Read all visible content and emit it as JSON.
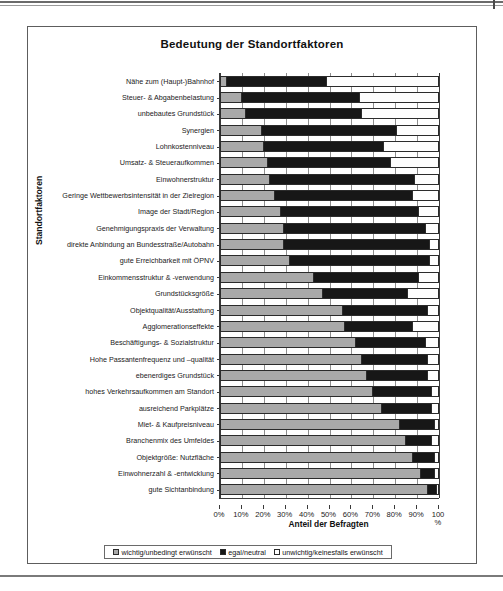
{
  "chart_data": {
    "type": "bar",
    "orientation": "horizontal",
    "stacked": true,
    "stacked_percent": true,
    "title": "Bedeutung der Standortfaktoren",
    "xlabel": "Anteil der Befragten",
    "ylabel": "Standortfaktoren",
    "xlim": [
      0,
      100
    ],
    "xticks": [
      "0%",
      "10%",
      "20%",
      "30%",
      "40%",
      "50%",
      "60%",
      "70%",
      "80%",
      "90%",
      "100"
    ],
    "xtick_suffix": "%",
    "grid": true,
    "legend_position": "bottom",
    "legend": [
      "wichtig/unbedingt erwünscht",
      "egal/neutral",
      "unwichtig/keinesfalls erwünscht"
    ],
    "series_colors": {
      "wichtig": "#a9a9a9",
      "egal": "#171717",
      "unwichtig": "#ffffff"
    },
    "categories": [
      "Nähe zum (Haupt-)Bahnhof",
      "Steuer- & Abgabenbelastung",
      "unbebautes Grundstück",
      "Synergien",
      "Lohnkostenniveau",
      "Umsatz- & Steueraufkommen",
      "Einwohnerstruktur",
      "Geringe Wettbewerbsintensität in der Zielregion",
      "Image der Stadt/Region",
      "Genehmigungspraxis der Verwaltung",
      "direkte Anbindung an Bundesstraße/Autobahn",
      "gute Erreichbarkeit mit ÖPNV",
      "Einkommensstruktur & -verwendung",
      "Grundstücksgröße",
      "Objektqualität/Ausstattung",
      "Agglomerationseffekte",
      "Beschäftigungs- & Sozialstruktur",
      "Hohe Passantenfrequenz und –qualität",
      "ebenerdiges Grundstück",
      "hohes Verkehrsaufkommen am Standort",
      "ausreichend Parkplätze",
      "Miet- & Kaufpreisniveau",
      "Branchenmix des Umfeldes",
      "Objektgröße: Nutzfläche",
      "Einwohnerzahl & -entwicklung",
      "gute Sichtanbindung"
    ],
    "series": [
      {
        "name": "wichtig/unbedingt erwünscht",
        "values": [
          3,
          10,
          12,
          19,
          20,
          22,
          23,
          25,
          28,
          29,
          29,
          32,
          43,
          47,
          56,
          57,
          62,
          65,
          67,
          70,
          74,
          82,
          85,
          88,
          92,
          95
        ]
      },
      {
        "name": "egal/neutral",
        "values": [
          46,
          54,
          53,
          62,
          55,
          56,
          66,
          63,
          63,
          65,
          67,
          64,
          48,
          39,
          39,
          31,
          32,
          30,
          28,
          27,
          23,
          16,
          12,
          10,
          6,
          4
        ]
      },
      {
        "name": "unwichtig/keinesfalls erwünscht",
        "values": [
          51,
          36,
          35,
          19,
          25,
          22,
          11,
          12,
          9,
          6,
          4,
          4,
          9,
          14,
          5,
          12,
          6,
          5,
          5,
          3,
          3,
          2,
          3,
          2,
          2,
          1
        ]
      }
    ]
  }
}
